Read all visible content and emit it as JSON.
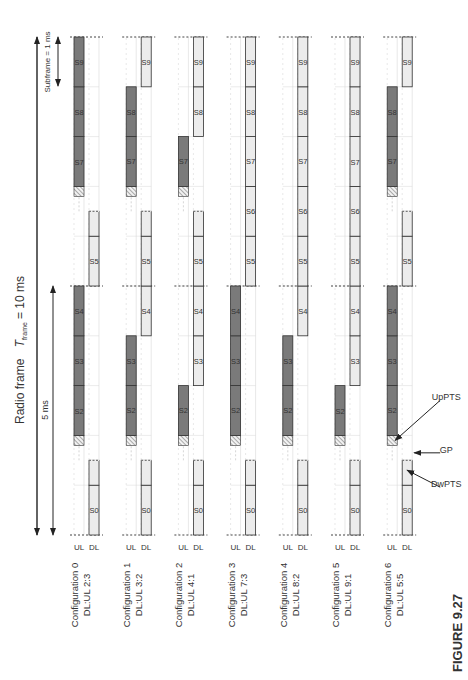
{
  "header": {
    "radio_frame_label": "Radio frame",
    "t_frame_symbol": "T",
    "t_frame_subscript": "frame",
    "t_frame_value": "= 10 ms",
    "half_frame_label": "5 ms",
    "subframe_label": "Subframe = 1 ms"
  },
  "channel_labels": {
    "ul": "UL",
    "dl": "DL"
  },
  "subframe_names": [
    "S0",
    "S1",
    "S2",
    "S3",
    "S4",
    "S5",
    "S6",
    "S7",
    "S8",
    "S9"
  ],
  "special_subframe_labels": {
    "dwpts": "DwPTS",
    "gp": "GP",
    "uppts": "UpPTS"
  },
  "configurations": [
    {
      "name": "Configuration 0",
      "ratio": "DL:UL 2:3",
      "pattern": [
        "D",
        "S",
        "U",
        "U",
        "U",
        "D",
        "S",
        "U",
        "U",
        "U"
      ]
    },
    {
      "name": "Configuration 1",
      "ratio": "DL:UL 3:2",
      "pattern": [
        "D",
        "S",
        "U",
        "U",
        "D",
        "D",
        "S",
        "U",
        "U",
        "D"
      ]
    },
    {
      "name": "Configuration 2",
      "ratio": "DL:UL 4:1",
      "pattern": [
        "D",
        "S",
        "U",
        "D",
        "D",
        "D",
        "S",
        "U",
        "D",
        "D"
      ]
    },
    {
      "name": "Configuration 3",
      "ratio": "DL:UL 7:3",
      "pattern": [
        "D",
        "S",
        "U",
        "U",
        "U",
        "D",
        "D",
        "D",
        "D",
        "D"
      ]
    },
    {
      "name": "Configuration 4",
      "ratio": "DL:UL 8:2",
      "pattern": [
        "D",
        "S",
        "U",
        "U",
        "D",
        "D",
        "D",
        "D",
        "D",
        "D"
      ]
    },
    {
      "name": "Configuration 5",
      "ratio": "DL:UL 9:1",
      "pattern": [
        "D",
        "S",
        "U",
        "D",
        "D",
        "D",
        "D",
        "D",
        "D",
        "D"
      ]
    },
    {
      "name": "Configuration 6",
      "ratio": "DL:UL 5:5",
      "pattern": [
        "D",
        "S",
        "U",
        "U",
        "U",
        "D",
        "S",
        "U",
        "U",
        "D"
      ]
    }
  ],
  "colors": {
    "uplink": "#7a7a7a",
    "downlink": "#ececec",
    "outline": "#333333",
    "grid": "#d8d8d8"
  },
  "figure_caption": "FIGURE 9.27"
}
